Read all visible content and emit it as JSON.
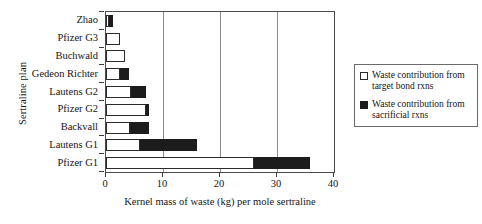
{
  "chart_data": {
    "type": "bar",
    "orientation": "horizontal",
    "stacked": true,
    "title": "",
    "xlabel": "Kernel mass of waste (kg) per mole sertraline",
    "ylabel": "Sertraline plan",
    "xlim": [
      0,
      40
    ],
    "xticks": [
      0,
      10,
      20,
      30,
      40
    ],
    "xtick_labels": [
      "0",
      "10",
      "20",
      "30",
      "40"
    ],
    "grid": "vertical",
    "legend_position": "right",
    "categories": [
      "Zhao",
      "Pfizer G3",
      "Buchwald",
      "Gedeon Richter",
      "Lautens G2",
      "Pfizer G2",
      "Backvall",
      "Lautens G1",
      "Pfizer G1"
    ],
    "series": [
      {
        "name": "Waste contribution from target bond rxns",
        "color": "#ffffff",
        "values": [
          0.5,
          2.5,
          3.3,
          2.5,
          4.4,
          7.0,
          4.2,
          6.0,
          26.0
        ]
      },
      {
        "name": "Waste contribution from sacrificial rxns",
        "color": "#1c1c1c",
        "values": [
          0.8,
          0.0,
          0.0,
          1.5,
          2.6,
          0.5,
          3.3,
          10.0,
          9.8
        ]
      }
    ],
    "totals": [
      1.3,
      2.5,
      3.3,
      4.0,
      7.0,
      7.5,
      7.5,
      16.0,
      35.8
    ]
  },
  "legend": {
    "entries": [
      {
        "swatch": "open-square-icon",
        "label": "Waste contribution from target bond rxns"
      },
      {
        "swatch": "filled-square-icon",
        "label": "Waste contribution from sacrificial rxns"
      }
    ]
  },
  "colors": {
    "target_bond": "#ffffff",
    "sacrificial": "#1c1c1c",
    "axis": "#4a4a4a",
    "gridline": "#8c8c8c",
    "background": "#ffffff"
  }
}
